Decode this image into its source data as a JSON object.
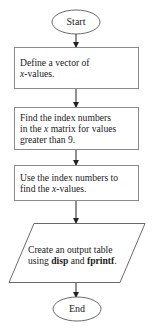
{
  "flowchart": {
    "colors": {
      "stroke": "#6a6a6a",
      "arrow": "#222222",
      "text": "#222222",
      "background": "#ffffff"
    },
    "nodes": [
      {
        "id": "start",
        "shape": "terminator",
        "label": "Start"
      },
      {
        "id": "step1",
        "shape": "process",
        "line1": "Define a vector of",
        "line2_var": "x",
        "line2_rest": "-values."
      },
      {
        "id": "step2",
        "shape": "process",
        "line1": "Find the index numbers",
        "line2_pre": "in the ",
        "line2_var": "x",
        "line2_post": " matrix for values",
        "line3": "greater than 9."
      },
      {
        "id": "step3",
        "shape": "process",
        "line1": "Use the index numbers to",
        "line2_pre": "find the ",
        "line2_var": "x",
        "line2_post": "-values."
      },
      {
        "id": "output",
        "shape": "io",
        "line1": "Create an output table",
        "line2_pre": "using ",
        "line2_cmd1": "disp",
        "line2_mid": " and ",
        "line2_cmd2": "fprintf",
        "line2_end": "."
      },
      {
        "id": "end",
        "shape": "terminator",
        "label": "End"
      }
    ],
    "edges": [
      {
        "from": "start",
        "to": "step1"
      },
      {
        "from": "step1",
        "to": "step2"
      },
      {
        "from": "step2",
        "to": "step3"
      },
      {
        "from": "step3",
        "to": "output"
      },
      {
        "from": "output",
        "to": "end"
      }
    ]
  }
}
